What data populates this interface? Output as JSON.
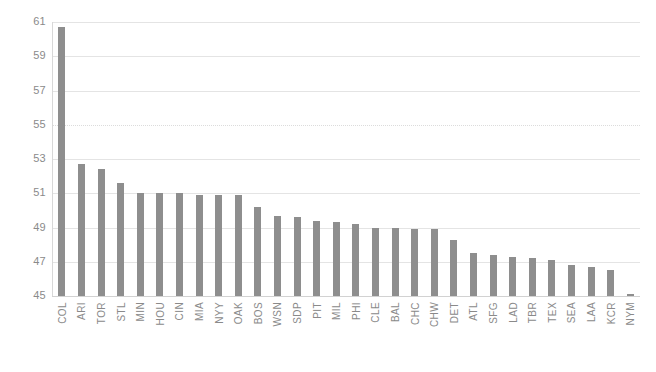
{
  "chart_data": {
    "type": "bar",
    "title": "",
    "xlabel": "",
    "ylabel": "",
    "ylim": [
      45,
      61
    ],
    "ytick_step": 2,
    "yticks": [
      61,
      59,
      57,
      55,
      53,
      51,
      49,
      47,
      45
    ],
    "grid": true,
    "legend": null,
    "bar_color": "#8e8e8e",
    "categories": [
      "COL",
      "ARI",
      "TOR",
      "STL",
      "MIN",
      "HOU",
      "CIN",
      "MIA",
      "NYY",
      "OAK",
      "BOS",
      "WSN",
      "SDP",
      "PIT",
      "MIL",
      "PHI",
      "CLE",
      "BAL",
      "CHC",
      "CHW",
      "DET",
      "ATL",
      "SFG",
      "LAD",
      "TBR",
      "TEX",
      "SEA",
      "LAA",
      "KCR",
      "NYM"
    ],
    "values": [
      60.7,
      52.7,
      52.4,
      51.6,
      51.0,
      51.0,
      51.0,
      50.9,
      50.9,
      50.9,
      50.2,
      49.7,
      49.6,
      49.4,
      49.3,
      49.2,
      49.0,
      49.0,
      48.9,
      48.9,
      48.3,
      47.5,
      47.4,
      47.3,
      47.2,
      47.1,
      46.8,
      46.7,
      46.5,
      45.1
    ]
  },
  "chart": {
    "title_faint": "",
    "axis_color": "#8a8a8a",
    "grid_color": "#e4e4e4"
  }
}
